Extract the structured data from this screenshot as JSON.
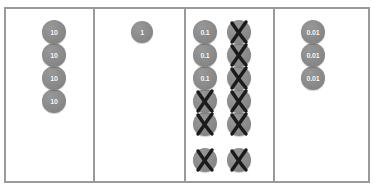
{
  "chart_data": {
    "type": "table",
    "columns": [
      {
        "name": "tens",
        "place_value": "10",
        "groups": [
          {
            "name": "tens-stack",
            "discs": [
              {
                "label": "10",
                "crossed": false
              },
              {
                "label": "10",
                "crossed": false
              },
              {
                "label": "10",
                "crossed": false
              },
              {
                "label": "10",
                "crossed": false
              }
            ]
          }
        ],
        "total_counters": 4,
        "crossed_counters": 0
      },
      {
        "name": "ones",
        "place_value": "1",
        "groups": [
          {
            "name": "ones-stack",
            "discs": [
              {
                "label": "1",
                "crossed": false
              }
            ]
          }
        ],
        "total_counters": 1,
        "crossed_counters": 0
      },
      {
        "name": "tenths",
        "place_value": "0.1",
        "groups": [
          {
            "name": "tenths-stack-left",
            "discs": [
              {
                "label": "0.1",
                "crossed": false
              },
              {
                "label": "0.1",
                "crossed": false
              },
              {
                "label": "0.1",
                "crossed": false
              },
              {
                "label": "0.1",
                "crossed": true
              },
              {
                "label": "0.1",
                "crossed": true
              }
            ]
          },
          {
            "name": "tenths-stack-right",
            "discs": [
              {
                "label": "0.1",
                "crossed": true
              },
              {
                "label": "0.1",
                "crossed": true
              },
              {
                "label": "0.1",
                "crossed": true
              },
              {
                "label": "0.1",
                "crossed": true
              },
              {
                "label": "0.1",
                "crossed": true
              }
            ]
          },
          {
            "name": "tenths-loose-row",
            "discs": [
              {
                "label": "0.1",
                "crossed": true
              },
              {
                "label": "0.1",
                "crossed": true
              }
            ]
          }
        ],
        "total_counters": 12,
        "crossed_counters": 9
      },
      {
        "name": "hundredths",
        "place_value": "0.01",
        "groups": [
          {
            "name": "hundredths-stack",
            "discs": [
              {
                "label": "0.01",
                "crossed": false
              },
              {
                "label": "0.01",
                "crossed": false
              },
              {
                "label": "0.01",
                "crossed": false
              }
            ]
          }
        ],
        "total_counters": 3,
        "crossed_counters": 0
      }
    ]
  },
  "colors": {
    "counter_fill": "#8a8a8a",
    "counter_text": "#ffffff",
    "cross_mark": "#1b1b1b",
    "border": "#9a9a9a",
    "background": "#ffffff"
  }
}
